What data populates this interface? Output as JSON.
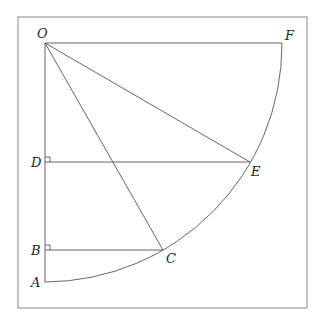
{
  "diagram": {
    "points": {
      "O": {
        "label": "O"
      },
      "F": {
        "label": "F"
      },
      "D": {
        "label": "D"
      },
      "E": {
        "label": "E"
      },
      "B": {
        "label": "B"
      },
      "C": {
        "label": "C"
      },
      "A": {
        "label": "A"
      }
    },
    "segments": [
      "OF",
      "OA",
      "OE",
      "OC",
      "DE",
      "BC"
    ],
    "arcs": [
      "AF (quarter circle centered at O)"
    ],
    "right_angles": [
      "D",
      "B"
    ]
  }
}
